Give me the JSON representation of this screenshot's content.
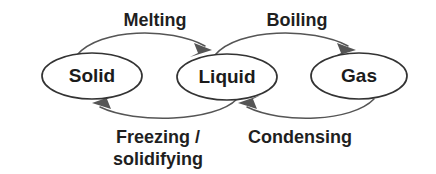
{
  "diagram": {
    "background_color": "#ffffff",
    "node_stroke_color": "#333333",
    "edge_stroke_color": "#555555",
    "text_color": "#1b1b1b",
    "nodes": [
      {
        "id": "solid",
        "label": "Solid",
        "cx": 92,
        "cy": 76,
        "rx": 50,
        "ry": 23
      },
      {
        "id": "liquid",
        "label": "Liquid",
        "cx": 227,
        "cy": 77,
        "rx": 50,
        "ry": 23
      },
      {
        "id": "gas",
        "label": "Gas",
        "cx": 359,
        "cy": 76,
        "rx": 48,
        "ry": 23
      }
    ],
    "edges": [
      {
        "id": "melting",
        "label": "Melting",
        "from": "solid",
        "to": "liquid",
        "label_x": 155,
        "label_y": 20,
        "label_lines": [
          "Melting"
        ]
      },
      {
        "id": "boiling",
        "label": "Boiling",
        "from": "liquid",
        "to": "gas",
        "label_x": 297,
        "label_y": 20,
        "label_lines": [
          "Boiling"
        ]
      },
      {
        "id": "freezing-solidifying",
        "label": "Freezing / solidifying",
        "from": "liquid",
        "to": "solid",
        "label_x": 158,
        "label_y": 143,
        "label_lines": [
          "Freezing /",
          "solidifying"
        ]
      },
      {
        "id": "condensing",
        "label": "Condensing",
        "from": "gas",
        "to": "liquid",
        "label_x": 300,
        "label_y": 143,
        "label_lines": [
          "Condensing"
        ]
      }
    ]
  }
}
